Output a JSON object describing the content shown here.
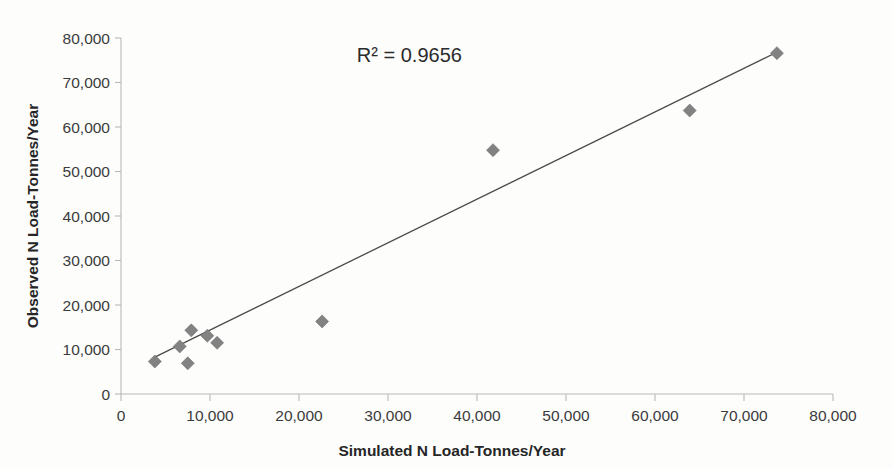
{
  "chart_data": {
    "type": "scatter",
    "title": "",
    "xlabel": "Simulated N Load-Tonnes/Year",
    "ylabel": "Observed  N Load-Tonnes/Year",
    "xlim": [
      0,
      80000
    ],
    "ylim": [
      0,
      80000
    ],
    "grid": false,
    "legend": null,
    "x_ticks": [
      0,
      10000,
      20000,
      30000,
      40000,
      50000,
      60000,
      70000,
      80000
    ],
    "y_ticks": [
      0,
      10000,
      20000,
      30000,
      40000,
      50000,
      60000,
      70000,
      80000
    ],
    "x_tick_labels": [
      "0",
      "10,000",
      "20,000",
      "30,000",
      "40,000",
      "50,000",
      "60,000",
      "70,000",
      "80,000"
    ],
    "y_tick_labels": [
      "0",
      "10,000",
      "20,000",
      "30,000",
      "40,000",
      "50,000",
      "60,000",
      "70,000",
      "80,000"
    ],
    "annotations": [
      {
        "text": "R² = 0.9656",
        "x": 26500,
        "y": 74500
      }
    ],
    "marker": {
      "shape": "diamond",
      "color": "#828282",
      "size": 13
    },
    "series": [
      {
        "name": "Observed vs Simulated N Load",
        "points": [
          {
            "x": 3800,
            "y": 7300
          },
          {
            "x": 6600,
            "y": 10700
          },
          {
            "x": 7500,
            "y": 6900
          },
          {
            "x": 7900,
            "y": 14300
          },
          {
            "x": 9700,
            "y": 13100
          },
          {
            "x": 10800,
            "y": 11500
          },
          {
            "x": 22600,
            "y": 16300
          },
          {
            "x": 41800,
            "y": 54800
          },
          {
            "x": 63900,
            "y": 63700
          },
          {
            "x": 73700,
            "y": 76600
          }
        ]
      }
    ],
    "trendline": {
      "type": "linear",
      "r_squared": 0.9656,
      "r_squared_label": "R² = 0.9656",
      "x_start": 3800,
      "y_start": 8300,
      "x_end": 73700,
      "y_end": 76800,
      "color": "#4a4a4a"
    }
  },
  "axes": {
    "x_axis_name": "x-axis",
    "y_axis_name": "y-axis"
  }
}
